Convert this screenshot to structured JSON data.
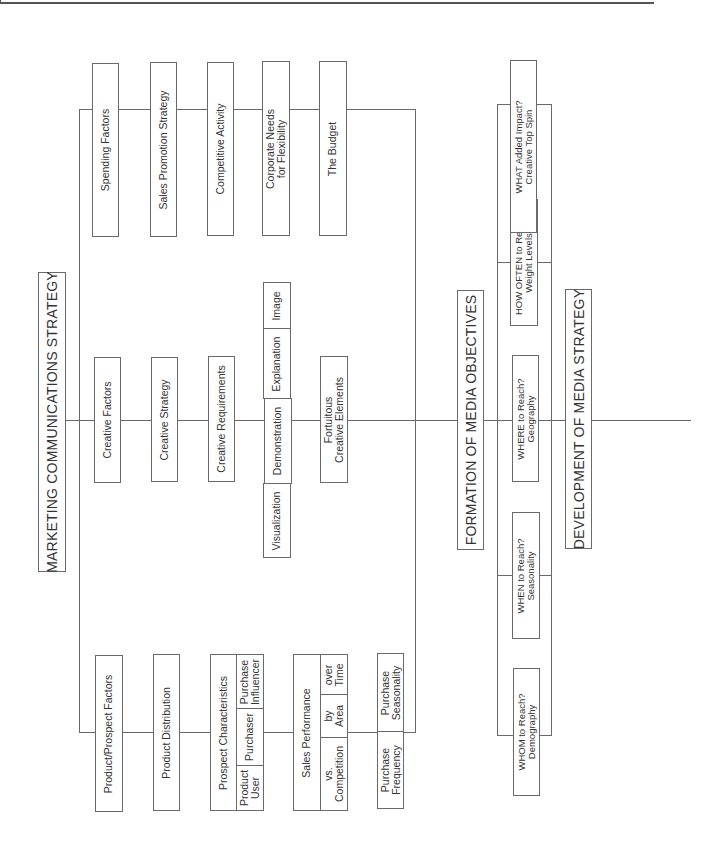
{
  "title": "MARKETING COMMUNICATIONS STRATEGY",
  "spending_factors": {
    "label": "Spending Factors",
    "items": [
      "Sales Promotion Strategy",
      "Competitive Activity",
      "Corporate Needs\nfor Flexibility",
      "The Budget"
    ]
  },
  "creative_factors": {
    "label": "Creative Factors",
    "items": [
      "Creative Strategy",
      "Creative Requirements"
    ],
    "requirements": [
      "Visualization",
      "Demonstration",
      "Explanation",
      "Image"
    ],
    "fortuitous": "Fortuitous\nCreative Elements"
  },
  "product_factors": {
    "label": "Product/Prospect Factors",
    "distribution": "Product Distribution",
    "prospect": {
      "label": "Prospect Characteristics",
      "sub": [
        "Product\nUser",
        "Purchaser",
        "Purchase\nInfluencer"
      ]
    },
    "sales": {
      "label": "Sales Performance",
      "sub": [
        "vs.\nCompetition",
        "by\nArea",
        "over\nTime"
      ]
    },
    "purchase": [
      "Purchase\nFrequency",
      "Purchase\nSeasonality"
    ]
  },
  "media_objectives": {
    "label": "FORMATION OF MEDIA OBJECTIVES",
    "items": [
      "WHOM to Reach?\nDemography",
      "WHEN to Reach?\nSeasonality",
      "WHERE to Reach?\nGeography",
      "HOW OFTEN to Reach?\nWeight Levels",
      "WHAT Added Impact?\nCreative Top Spin"
    ]
  },
  "media_strategy": {
    "label": "DEVELOPMENT OF MEDIA STRATEGY"
  }
}
